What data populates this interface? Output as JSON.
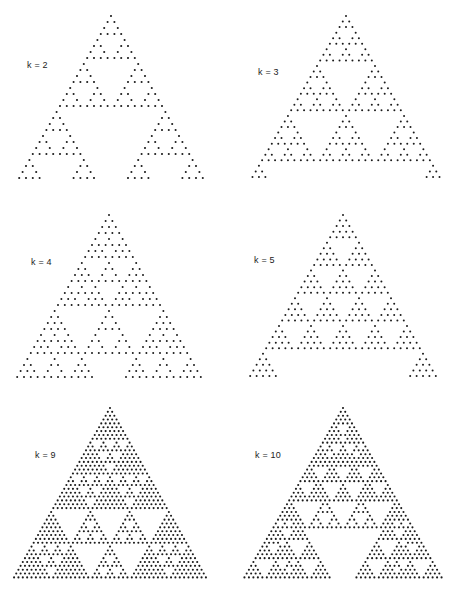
{
  "figure": {
    "dot_color": "#1a1a1a",
    "background": "#ffffff",
    "panels": [
      {
        "label": "k = 2",
        "k": 2,
        "rows": 28,
        "apex_x": 111,
        "apex_y": 16,
        "row_step": 6.0,
        "col_pitch": 6.8,
        "dot_r": 1.05,
        "label_x": 27,
        "label_y": 60
      },
      {
        "label": "k = 3",
        "k": 3,
        "rows": 30,
        "apex_x": 346,
        "apex_y": 16,
        "row_step": 5.55,
        "col_pitch": 6.45,
        "dot_r": 1.0,
        "label_x": 258,
        "label_y": 67
      },
      {
        "label": "k = 4",
        "k": 4,
        "rows": 28,
        "apex_x": 109,
        "apex_y": 215,
        "row_step": 6.0,
        "col_pitch": 6.8,
        "dot_r": 1.0,
        "label_x": 31,
        "label_y": 257
      },
      {
        "label": "k = 5",
        "k": 5,
        "rows": 30,
        "apex_x": 343,
        "apex_y": 215,
        "row_step": 5.55,
        "col_pitch": 6.4,
        "dot_r": 1.0,
        "label_x": 254,
        "label_y": 255
      },
      {
        "label": "k = 9",
        "k": 9,
        "rows": 45,
        "apex_x": 110,
        "apex_y": 408,
        "row_step": 3.85,
        "col_pitch": 4.36,
        "dot_r": 1.05,
        "label_x": 35,
        "label_y": 450
      },
      {
        "label": "k = 10",
        "k": 10,
        "rows": 45,
        "apex_x": 343,
        "apex_y": 408,
        "row_step": 3.85,
        "col_pitch": 4.48,
        "dot_r": 1.05,
        "label_x": 255,
        "label_y": 450
      }
    ]
  }
}
